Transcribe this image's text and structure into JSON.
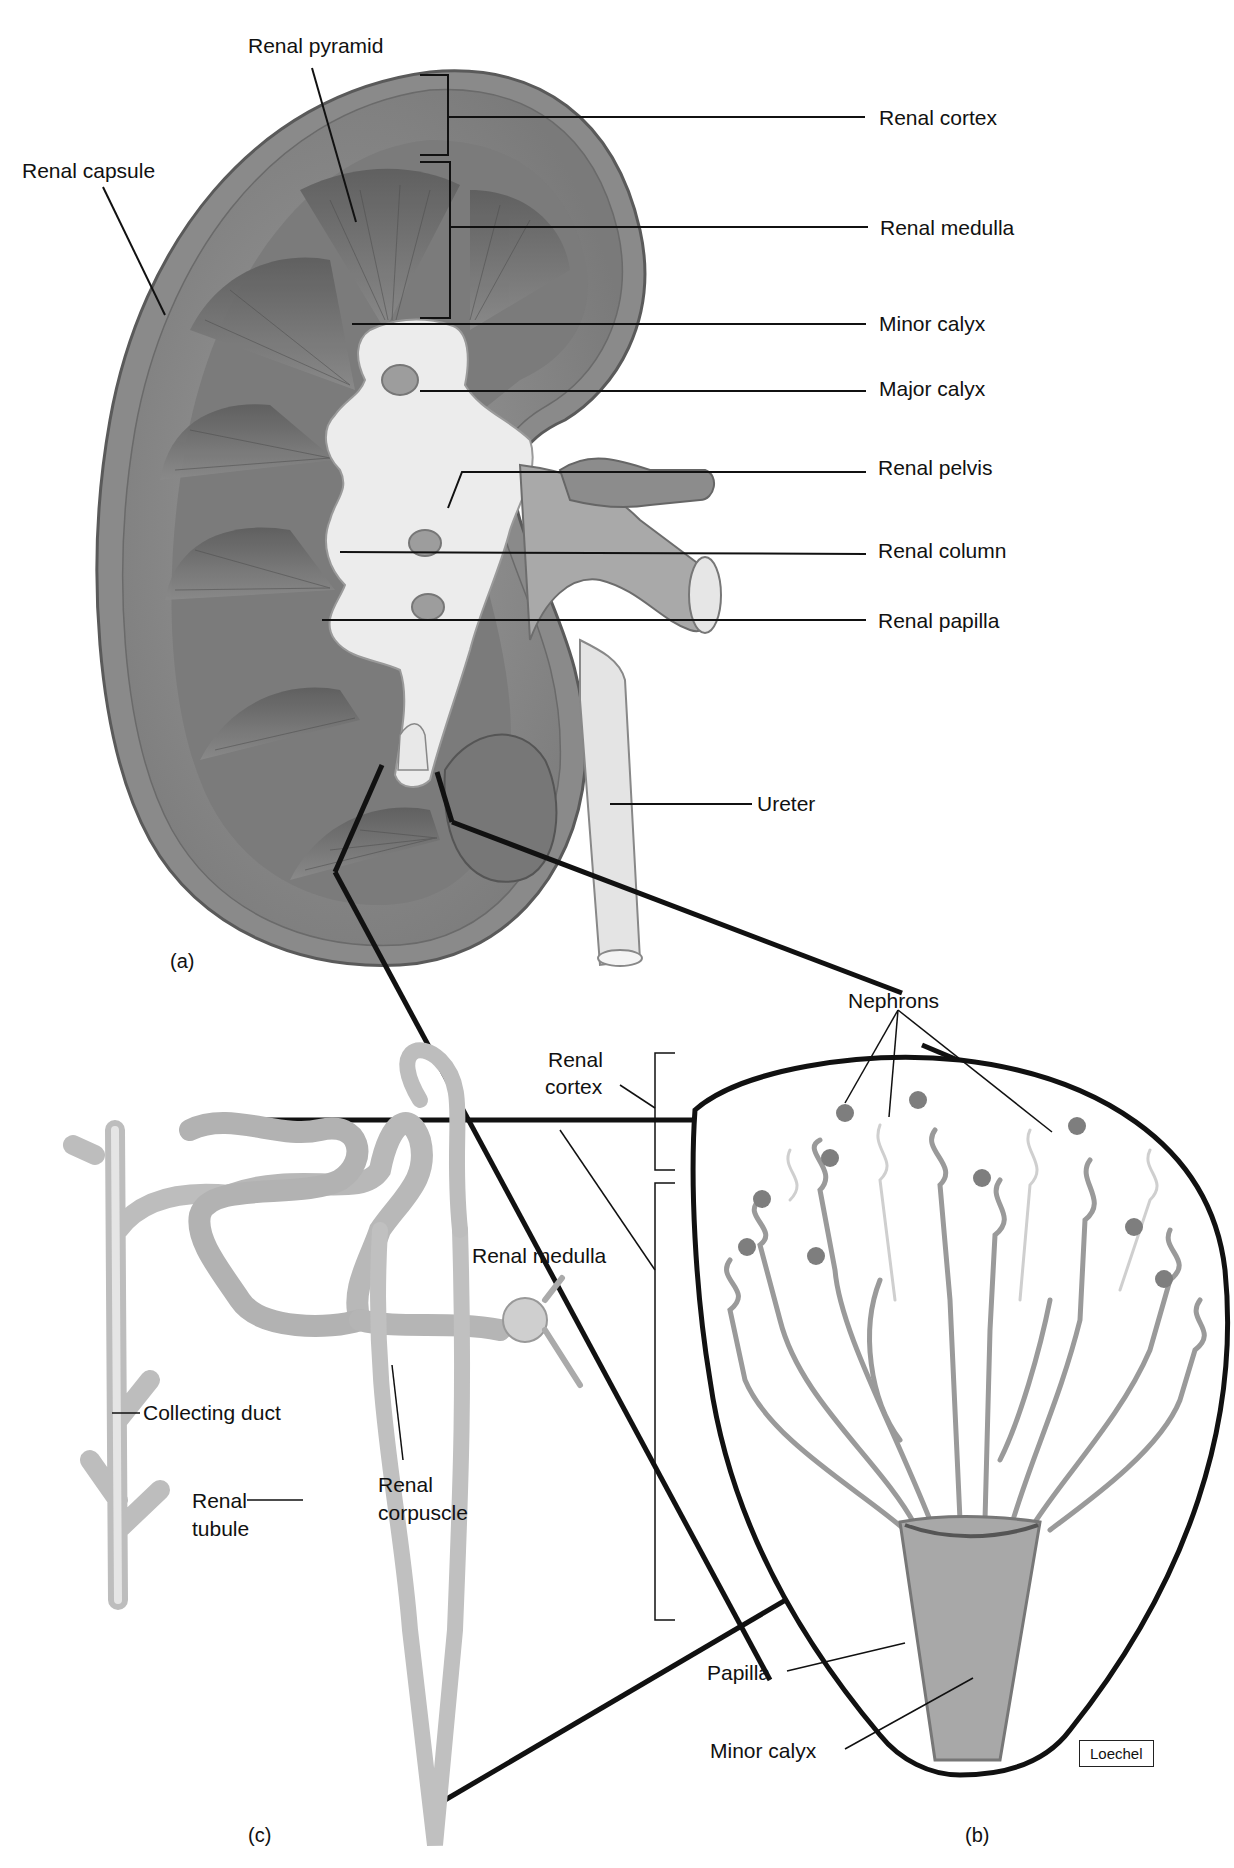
{
  "figure": {
    "colors": {
      "tissue_dark": "#6f6f6f",
      "tissue_mid": "#8c8c8c",
      "tissue_light": "#d6d6d6",
      "pelvis": "#ececec",
      "leader": "#111111",
      "background": "#ffffff"
    },
    "panels": {
      "a": {
        "tag": "(a)"
      },
      "b": {
        "tag": "(b)"
      },
      "c": {
        "tag": "(c)"
      }
    },
    "labels_a": {
      "renal_pyramid": "Renal pyramid",
      "renal_capsule": "Renal capsule",
      "renal_cortex": "Renal cortex",
      "renal_medulla": "Renal medulla",
      "minor_calyx": "Minor calyx",
      "major_calyx": "Major calyx",
      "renal_pelvis": "Renal pelvis",
      "renal_column": "Renal column",
      "renal_papilla": "Renal papilla",
      "ureter": "Ureter"
    },
    "labels_b": {
      "nephrons": "Nephrons",
      "renal_cortex_l1": "Renal",
      "renal_cortex_l2": "cortex",
      "renal_medulla": "Renal medulla",
      "papilla": "Papilla",
      "minor_calyx": "Minor calyx",
      "signature": "Loechel"
    },
    "labels_c": {
      "collecting_duct": "Collecting duct",
      "renal_tubule_l1": "Renal",
      "renal_tubule_l2": "tubule",
      "renal_corpuscle_l1": "Renal",
      "renal_corpuscle_l2": "corpuscle"
    }
  }
}
